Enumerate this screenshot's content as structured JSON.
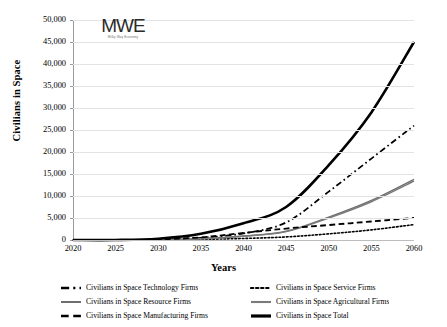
{
  "logo": {
    "mark": "MWE",
    "subtitle": "Milky Way Economy"
  },
  "axes": {
    "y_title": "Civilians in Space",
    "x_title": "Years",
    "y_ticks": [
      "50,000",
      "45,000",
      "40,000",
      "35,000",
      "30,000",
      "25,000",
      "20,000",
      "15,000",
      "10,000",
      "5,000",
      "0"
    ],
    "x_ticks": [
      "2020",
      "2025",
      "2030",
      "2035",
      "2040",
      "2045",
      "2050",
      "2055",
      "2060"
    ]
  },
  "legend": [
    {
      "label": "Civilians in Space Technology Firms",
      "style": "dash-dot",
      "width": 1.8,
      "color": "#000000"
    },
    {
      "label": "Civilians in Space Service Firms",
      "style": "dotted",
      "width": 1.6,
      "color": "#000000"
    },
    {
      "label": "Civilians in Space Resource Firms",
      "style": "solid",
      "width": 1.4,
      "color": "#6f6f6f"
    },
    {
      "label": "Civilians in Space Agricultural Firms",
      "style": "solid",
      "width": 1.5,
      "color": "#7a7a7a"
    },
    {
      "label": "Civilians in Space Manufacturing Firms",
      "style": "dashed",
      "width": 1.8,
      "color": "#000000"
    },
    {
      "label": "Civilians in Space Total",
      "style": "solid",
      "width": 2.6,
      "color": "#000000"
    }
  ],
  "chart_data": {
    "type": "line",
    "title": "",
    "xlabel": "Years",
    "ylabel": "Civilians in Space",
    "x": [
      2020,
      2025,
      2030,
      2035,
      2040,
      2045,
      2050,
      2055,
      2060
    ],
    "xlim": [
      2020,
      2060
    ],
    "ylim": [
      0,
      50000
    ],
    "ytick_step": 5000,
    "grid": "horizontal",
    "legend_position": "bottom",
    "series": [
      {
        "name": "Civilians in Space Technology Firms",
        "style": "dash-dot",
        "color": "#000000",
        "width": 1.8,
        "values": [
          0,
          0,
          100,
          500,
          1500,
          4000,
          11000,
          18500,
          26000
        ]
      },
      {
        "name": "Civilians in Space Service Firms",
        "style": "dotted",
        "color": "#000000",
        "width": 1.6,
        "values": [
          0,
          0,
          50,
          150,
          350,
          700,
          1400,
          2300,
          3500
        ]
      },
      {
        "name": "Civilians in Space Resource Firms",
        "style": "solid",
        "color": "#6f6f6f",
        "width": 1.4,
        "values": [
          0,
          0,
          80,
          300,
          900,
          2000,
          5200,
          9000,
          13800
        ]
      },
      {
        "name": "Civilians in Space Agricultural Firms",
        "style": "solid",
        "color": "#7a7a7a",
        "width": 1.5,
        "values": [
          0,
          0,
          70,
          280,
          850,
          1900,
          5000,
          8700,
          13400
        ]
      },
      {
        "name": "Civilians in Space Manufacturing Firms",
        "style": "dashed",
        "color": "#000000",
        "width": 1.8,
        "values": [
          0,
          0,
          120,
          600,
          1600,
          2600,
          3400,
          4200,
          5000
        ]
      },
      {
        "name": "Civilians in Space Total",
        "style": "solid",
        "color": "#000000",
        "width": 2.6,
        "values": [
          0,
          0,
          300,
          1400,
          3800,
          7500,
          17000,
          29000,
          45000
        ]
      }
    ]
  }
}
